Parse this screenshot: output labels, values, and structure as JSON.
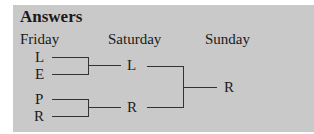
{
  "title": "Answers",
  "columns": [
    "Friday",
    "Saturday",
    "Sunday"
  ],
  "friday": [
    "L",
    "E",
    "P",
    "R"
  ],
  "saturday": [
    "L",
    "R"
  ],
  "sunday": [
    "R"
  ]
}
